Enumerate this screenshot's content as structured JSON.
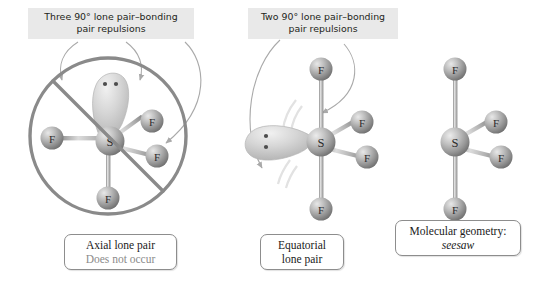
{
  "figure": {
    "background_color": "#ffffff",
    "atom_color": "#9a9a9a",
    "lone_pair_color": "#c9c9c9",
    "prohibition_color": "#8a8a8a",
    "arrow_color": "#a9a9a9",
    "label_plate_color": "#e9e9e9",
    "caption_border_color": "#8d8d8d",
    "muted_text_color": "#8b8b8b"
  },
  "callouts": {
    "left": {
      "line1": "Three 90° lone pair–bonding",
      "line2": "pair repulsions",
      "arrow_count": 3
    },
    "middle": {
      "line1": "Two 90° lone pair–bonding",
      "line2": "pair repulsions",
      "arrow_count": 2
    }
  },
  "panels": [
    {
      "id": "axial",
      "prohibited": true,
      "center_atom": "S",
      "lone_pair_position": "axial-top",
      "lone_pair_dots": 2,
      "ligands": [
        {
          "label": "F",
          "position": "left"
        },
        {
          "label": "F",
          "position": "upper-right"
        },
        {
          "label": "F",
          "position": "lower-right"
        },
        {
          "label": "F",
          "position": "bottom"
        }
      ],
      "caption": {
        "line1": "Axial lone pair",
        "line2": "Does not occur",
        "line2_muted": true
      }
    },
    {
      "id": "equatorial",
      "prohibited": false,
      "center_atom": "S",
      "lone_pair_position": "equatorial-left",
      "lone_pair_dots": 2,
      "ligands": [
        {
          "label": "F",
          "position": "top"
        },
        {
          "label": "F",
          "position": "upper-right"
        },
        {
          "label": "F",
          "position": "lower-right"
        },
        {
          "label": "F",
          "position": "bottom"
        }
      ],
      "caption": {
        "line1": "Equatorial",
        "line2": "lone pair",
        "line2_muted": false
      }
    },
    {
      "id": "geometry",
      "prohibited": false,
      "center_atom": "S",
      "lone_pair_position": "none",
      "lone_pair_dots": 0,
      "ligands": [
        {
          "label": "F",
          "position": "top"
        },
        {
          "label": "F",
          "position": "upper-right"
        },
        {
          "label": "F",
          "position": "lower-right"
        },
        {
          "label": "F",
          "position": "bottom"
        }
      ],
      "caption": {
        "line1": "Molecular geometry:",
        "line2": "seesaw",
        "line2_italic": true
      }
    }
  ],
  "atom_labels": {
    "sulfur": "S",
    "fluorine": "F"
  }
}
